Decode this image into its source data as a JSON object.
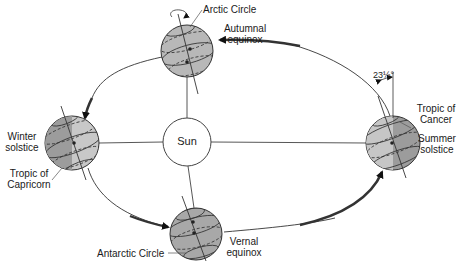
{
  "diagram": {
    "type": "earth-orbit-seasons",
    "center_body": {
      "label": "Sun"
    },
    "positions": [
      {
        "id": "autumnal",
        "label_line1": "Autumnal",
        "label_line2": "equinox"
      },
      {
        "id": "summer",
        "label_line1": "Summer",
        "label_line2": "solstice"
      },
      {
        "id": "vernal",
        "label_line1": "Vernal",
        "label_line2": "equinox"
      },
      {
        "id": "winter",
        "label_line1": "Winter",
        "label_line2": "solstice"
      }
    ],
    "annotations": {
      "arctic_circle": "Arctic Circle",
      "antarctic_circle": "Antarctic Circle",
      "tropic_cancer_line1": "Tropic of",
      "tropic_cancer_line2": "Cancer",
      "tropic_capricorn_line1": "Tropic of",
      "tropic_capricorn_line2": "Capricorn",
      "tilt_angle": "23½°"
    },
    "colors": {
      "globe_light": "#c4c4c4",
      "globe_dark": "#9a9a9a",
      "globe_mid": "#ababab",
      "line": "#222222",
      "orbit": "#333333"
    }
  }
}
